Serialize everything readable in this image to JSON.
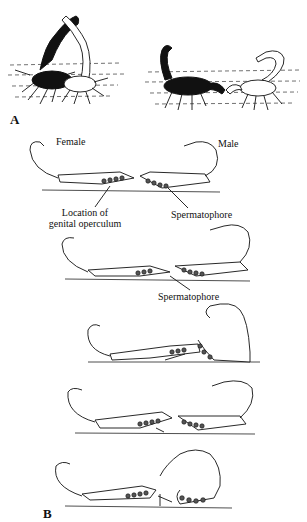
{
  "figure": {
    "panel_a": {
      "label": "A",
      "description": "Two illustrations of scorpion courtship (promenade à deux): dark female and light male grasping; female and male pulling with pedipalps"
    },
    "panel_b": {
      "label": "B",
      "stages": [
        {
          "index": 1,
          "labels": {
            "female": "Female",
            "male": "Male",
            "genital_operculum": "Location of\ngenital operculum",
            "spermatophore": "Spermatophore"
          }
        },
        {
          "index": 2,
          "labels": {
            "spermatophore": "Spermatophore"
          }
        },
        {
          "index": 3,
          "labels": {}
        },
        {
          "index": 4,
          "labels": {}
        },
        {
          "index": 5,
          "labels": {}
        }
      ]
    }
  },
  "text": {
    "label_a": "A",
    "label_b": "B",
    "female": "Female",
    "male": "Male",
    "genital_operculum_line1": "Location of",
    "genital_operculum_line2": "genital operculum",
    "spermatophore_1": "Spermatophore",
    "spermatophore_2": "Spermatophore"
  }
}
